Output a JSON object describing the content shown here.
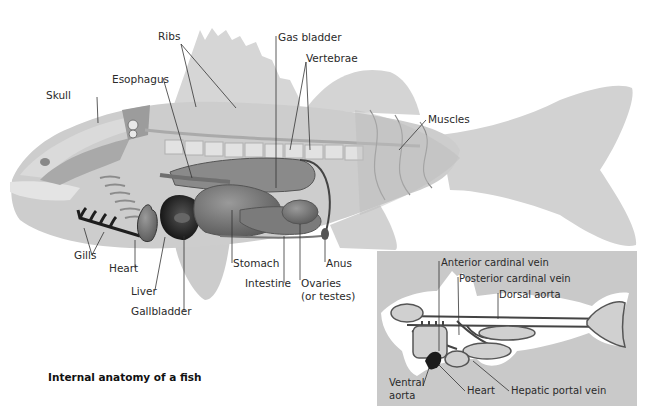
{
  "figure": {
    "caption": "Internal anatomy of a fish",
    "colors": {
      "background": "#ffffff",
      "body": "#cfcfcf",
      "fin": "#d4d4d4",
      "organ_dark": "#3a3a3a",
      "organ_mid": "#7a7a7a",
      "inset_bg": "#c9c9c9",
      "inset_fish": "#ffffff",
      "vessels": "#444444"
    }
  },
  "main_labels": {
    "skull": "Skull",
    "esophagus": "Esophagus",
    "ribs": "Ribs",
    "gas_bladder": "Gas bladder",
    "vertebrae": "Vertebrae",
    "muscles": "Muscles",
    "gills": "Gills",
    "heart": "Heart",
    "liver": "Liver",
    "gallbladder": "Gallbladder",
    "stomach": "Stomach",
    "intestine": "Intestine",
    "ovaries_line1": "Ovaries",
    "ovaries_line2": "(or testes)",
    "anus": "Anus"
  },
  "inset_labels": {
    "anterior_cardinal_vein": "Anterior cardinal vein",
    "posterior_cardinal_vein": "Posterior cardinal vein",
    "dorsal_aorta": "Dorsal aorta",
    "ventral_aorta_line1": "Ventral",
    "ventral_aorta_line2": "aorta",
    "heart": "Heart",
    "hepatic_portal_vein": "Hepatic portal vein"
  }
}
